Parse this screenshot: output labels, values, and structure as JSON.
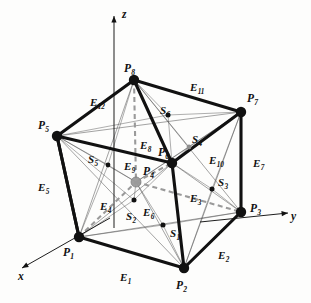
{
  "figure": {
    "colors": {
      "ink": "#111111",
      "thin_line": "#555555",
      "dashed_hidden": "#9a9a9a",
      "center_point": "#9b9b9b",
      "background": "#fdfdfc"
    }
  },
  "axes": [
    {
      "name": "x",
      "label": "x",
      "x": 18,
      "y": 271,
      "dir": "lower-left"
    },
    {
      "name": "y",
      "label": "y",
      "x": 291,
      "y": 211,
      "dir": "right"
    },
    {
      "name": "z",
      "label": "z",
      "x": 122,
      "y": 9,
      "dir": "up"
    }
  ],
  "vertices": [
    {
      "name": "P1",
      "base": "P",
      "sub": "1",
      "cx": 79,
      "cy": 237,
      "lx": 63,
      "ly": 247,
      "hidden": false
    },
    {
      "name": "P2",
      "base": "P",
      "sub": "2",
      "cx": 184,
      "cy": 268,
      "lx": 176,
      "ly": 280,
      "hidden": false
    },
    {
      "name": "P3",
      "base": "P",
      "sub": "3",
      "cx": 241,
      "cy": 212,
      "lx": 250,
      "ly": 203,
      "hidden": false
    },
    {
      "name": "P4",
      "base": "P",
      "sub": "4",
      "cx": 136,
      "cy": 182,
      "lx": 143,
      "ly": 166,
      "hidden": true
    },
    {
      "name": "P5",
      "base": "P",
      "sub": "5",
      "cx": 57,
      "cy": 136,
      "lx": 38,
      "ly": 120,
      "hidden": false
    },
    {
      "name": "P6",
      "base": "P",
      "sub": "6",
      "cx": 172,
      "cy": 163,
      "lx": 158,
      "ly": 147,
      "hidden": false
    },
    {
      "name": "P7",
      "base": "P",
      "sub": "7",
      "cx": 241,
      "cy": 112,
      "lx": 247,
      "ly": 93,
      "hidden": false
    },
    {
      "name": "P8",
      "base": "P",
      "sub": "8",
      "cx": 134,
      "cy": 80,
      "lx": 124,
      "ly": 63,
      "hidden": false
    }
  ],
  "edges": [
    {
      "name": "E1",
      "base": "E",
      "sub": "1",
      "lx": 120,
      "ly": 272,
      "from": "P1",
      "to": "P2",
      "hidden": false
    },
    {
      "name": "E2",
      "base": "E",
      "sub": "2",
      "lx": 218,
      "ly": 250,
      "from": "P2",
      "to": "P3",
      "hidden": false
    },
    {
      "name": "E3",
      "base": "E",
      "sub": "3",
      "lx": 190,
      "ly": 193,
      "from": "P6",
      "to": "P2",
      "hidden": false
    },
    {
      "name": "E4",
      "base": "E",
      "sub": "4",
      "lx": 100,
      "ly": 201,
      "from": "P1",
      "to": "P4",
      "hidden": true
    },
    {
      "name": "E5",
      "base": "E",
      "sub": "5",
      "lx": 38,
      "ly": 182,
      "from": "P5",
      "to": "P1",
      "hidden": false
    },
    {
      "name": "E6",
      "base": "E",
      "sub": "6",
      "lx": 143,
      "ly": 207,
      "from": "P4",
      "to": "P3",
      "hidden": true
    },
    {
      "name": "E7",
      "base": "E",
      "sub": "7",
      "lx": 253,
      "ly": 158,
      "from": "P7",
      "to": "P3",
      "hidden": false
    },
    {
      "name": "E8",
      "base": "E",
      "sub": "8",
      "lx": 140,
      "ly": 140,
      "from": "P8",
      "to": "P4",
      "hidden": true
    },
    {
      "name": "E9",
      "base": "E",
      "sub": "9",
      "lx": 124,
      "ly": 161,
      "from": "P4",
      "to": "P6",
      "hidden": true
    },
    {
      "name": "E10",
      "base": "E",
      "sub": "10",
      "lx": 209,
      "ly": 155,
      "from": "P6",
      "to": "P7",
      "hidden": false
    },
    {
      "name": "E11",
      "base": "E",
      "sub": "11",
      "lx": 190,
      "ly": 82,
      "from": "P8",
      "to": "P7",
      "hidden": false
    },
    {
      "name": "E12",
      "base": "E",
      "sub": "12",
      "lx": 90,
      "ly": 97,
      "from": "P5",
      "to": "P8",
      "hidden": false
    }
  ],
  "face_centers": [
    {
      "name": "S1",
      "base": "S",
      "sub": "1",
      "cx": 163,
      "cy": 225,
      "lx": 170,
      "ly": 228
    },
    {
      "name": "S2",
      "base": "S",
      "sub": "2",
      "cx": 134,
      "cy": 200,
      "lx": 126,
      "ly": 211
    },
    {
      "name": "S3",
      "base": "S",
      "sub": "3",
      "cx": 212,
      "cy": 189,
      "lx": 218,
      "ly": 177
    },
    {
      "name": "S4",
      "base": "S",
      "sub": "4",
      "cx": 189,
      "cy": 147,
      "lx": 192,
      "ly": 134
    },
    {
      "name": "S5",
      "base": "S",
      "sub": "5",
      "cx": 108,
      "cy": 165,
      "lx": 88,
      "ly": 154
    },
    {
      "name": "S6",
      "base": "S",
      "sub": "6",
      "cx": 168,
      "cy": 115,
      "lx": 160,
      "ly": 105
    }
  ],
  "geometry": {
    "solid_edges": [
      [
        79,
        237,
        184,
        268
      ],
      [
        184,
        268,
        241,
        212
      ],
      [
        241,
        212,
        241,
        112
      ],
      [
        57,
        136,
        79,
        237
      ],
      [
        79,
        237,
        57,
        136
      ],
      [
        57,
        136,
        134,
        80
      ],
      [
        134,
        80,
        241,
        112
      ],
      [
        172,
        163,
        241,
        112
      ],
      [
        172,
        163,
        184,
        268
      ],
      [
        57,
        136,
        172,
        163
      ],
      [
        134,
        80,
        172,
        163
      ]
    ],
    "hidden_edges": [
      [
        134,
        80,
        136,
        182
      ],
      [
        136,
        182,
        172,
        163
      ],
      [
        136,
        182,
        241,
        212
      ],
      [
        79,
        237,
        136,
        182
      ]
    ],
    "thin_rays": [
      [
        79,
        237,
        163,
        225
      ],
      [
        184,
        268,
        163,
        225
      ],
      [
        241,
        212,
        163,
        225
      ],
      [
        136,
        182,
        163,
        225
      ],
      [
        79,
        237,
        134,
        200
      ],
      [
        57,
        136,
        134,
        200
      ],
      [
        172,
        163,
        134,
        200
      ],
      [
        136,
        182,
        134,
        200
      ],
      [
        184,
        268,
        212,
        189
      ],
      [
        241,
        212,
        212,
        189
      ],
      [
        241,
        112,
        212,
        189
      ],
      [
        172,
        163,
        212,
        189
      ],
      [
        172,
        163,
        189,
        147
      ],
      [
        241,
        112,
        189,
        147
      ],
      [
        134,
        80,
        189,
        147
      ],
      [
        136,
        182,
        189,
        147
      ],
      [
        57,
        136,
        108,
        165
      ],
      [
        79,
        237,
        108,
        165
      ],
      [
        134,
        80,
        108,
        165
      ],
      [
        136,
        182,
        108,
        165
      ],
      [
        57,
        136,
        168,
        115
      ],
      [
        134,
        80,
        168,
        115
      ],
      [
        241,
        112,
        168,
        115
      ],
      [
        172,
        163,
        168,
        115
      ]
    ],
    "face_diagonals_thin": [
      [
        57,
        136,
        241,
        112
      ],
      [
        134,
        80,
        172,
        163
      ],
      [
        79,
        237,
        241,
        212
      ],
      [
        136,
        182,
        184,
        268
      ],
      [
        57,
        136,
        184,
        268
      ],
      [
        79,
        237,
        172,
        163
      ],
      [
        172,
        163,
        241,
        212
      ],
      [
        184,
        268,
        241,
        112
      ],
      [
        134,
        80,
        241,
        212
      ],
      [
        136,
        182,
        241,
        112
      ],
      [
        57,
        136,
        136,
        182
      ],
      [
        79,
        237,
        134,
        80
      ]
    ]
  }
}
